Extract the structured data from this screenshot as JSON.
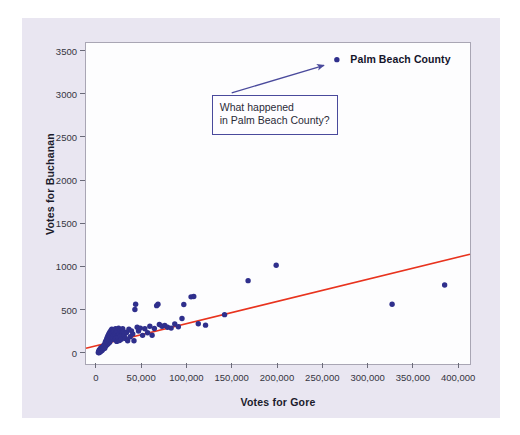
{
  "figure": {
    "background_color": "#e9e6f1",
    "plot_background_color": "#fdfdfe",
    "frame_color": "#a9a6b4"
  },
  "chart_data": {
    "type": "scatter",
    "title": "",
    "xlabel": "Votes for Gore",
    "ylabel": "Votes for Buchanan",
    "xlim": [
      -12000,
      412000
    ],
    "ylim": [
      -120,
      3600
    ],
    "xticks": [
      0,
      50000,
      100000,
      150000,
      200000,
      250000,
      300000,
      350000,
      400000
    ],
    "xticklabels": [
      "0",
      "50,000",
      "100,000",
      "150,000",
      "200,000",
      "250,000",
      "300,000",
      "350,000",
      "400,000"
    ],
    "yticks": [
      0,
      500,
      1000,
      1500,
      2000,
      2500,
      3000,
      3500
    ],
    "yticklabels": [
      "0",
      "500",
      "1000",
      "1500",
      "2000",
      "2500",
      "3000",
      "3500"
    ],
    "grid": false,
    "legend": null,
    "marker_color": "#2f2f8c",
    "marker_size": 5.4,
    "series": [
      {
        "name": "Florida counties",
        "points": [
          [
            2300,
            10
          ],
          [
            3000,
            25
          ],
          [
            3400,
            36
          ],
          [
            2700,
            42
          ],
          [
            4200,
            30
          ],
          [
            3900,
            55
          ],
          [
            5000,
            45
          ],
          [
            4500,
            70
          ],
          [
            5600,
            60
          ],
          [
            6100,
            78
          ],
          [
            6800,
            65
          ],
          [
            7200,
            90
          ],
          [
            7900,
            82
          ],
          [
            8300,
            105
          ],
          [
            8900,
            96
          ],
          [
            9500,
            120
          ],
          [
            10200,
            110
          ],
          [
            11000,
            135
          ],
          [
            11800,
            125
          ],
          [
            12400,
            150
          ],
          [
            13100,
            140
          ],
          [
            13900,
            165
          ],
          [
            14600,
            158
          ],
          [
            15300,
            180
          ],
          [
            16100,
            172
          ],
          [
            2100,
            18
          ],
          [
            2500,
            30
          ],
          [
            3200,
            20
          ],
          [
            3800,
            38
          ],
          [
            4400,
            28
          ],
          [
            5200,
            52
          ],
          [
            5900,
            40
          ],
          [
            6500,
            72
          ],
          [
            7100,
            58
          ],
          [
            7700,
            85
          ],
          [
            8500,
            68
          ],
          [
            9100,
            98
          ],
          [
            9800,
            88
          ],
          [
            10500,
            115
          ],
          [
            11300,
            102
          ],
          [
            12000,
            128
          ],
          [
            12700,
            118
          ],
          [
            13500,
            145
          ],
          [
            14200,
            132
          ],
          [
            15000,
            155
          ],
          [
            1600,
            12
          ],
          [
            1900,
            22
          ],
          [
            2800,
            16
          ],
          [
            3500,
            48
          ],
          [
            4800,
            34
          ],
          [
            5400,
            62
          ],
          [
            6200,
            50
          ],
          [
            7400,
            75
          ],
          [
            8100,
            92
          ],
          [
            8700,
            62
          ],
          [
            9300,
            132
          ],
          [
            10000,
            148
          ],
          [
            10800,
            168
          ],
          [
            11500,
            188
          ],
          [
            12200,
            205
          ],
          [
            13000,
            222
          ],
          [
            13800,
            238
          ],
          [
            14500,
            252
          ],
          [
            15600,
            268
          ],
          [
            16500,
            282
          ],
          [
            17300,
            240
          ],
          [
            18100,
            256
          ],
          [
            19000,
            272
          ],
          [
            17800,
            190
          ],
          [
            18600,
            206
          ],
          [
            19800,
            225
          ],
          [
            20600,
            288
          ],
          [
            21400,
            244
          ],
          [
            22300,
            262
          ],
          [
            23100,
            208
          ],
          [
            24000,
            296
          ],
          [
            24800,
            232
          ],
          [
            25700,
            276
          ],
          [
            26600,
            216
          ],
          [
            27500,
            248
          ],
          [
            20000,
            160
          ],
          [
            21000,
            175
          ],
          [
            22000,
            142
          ],
          [
            23500,
            186
          ],
          [
            25000,
            152
          ],
          [
            26000,
            198
          ],
          [
            27000,
            168
          ],
          [
            28500,
            290
          ],
          [
            29400,
            256
          ],
          [
            30200,
            212
          ],
          [
            31500,
            176
          ],
          [
            32800,
            246
          ],
          [
            34000,
            150
          ],
          [
            35400,
            282
          ],
          [
            36800,
            196
          ],
          [
            38200,
            264
          ],
          [
            39600,
            228
          ],
          [
            41000,
            150
          ],
          [
            42000,
            512
          ],
          [
            42800,
            572
          ],
          [
            44500,
            306
          ],
          [
            46000,
            262
          ],
          [
            48000,
            296
          ],
          [
            50500,
            212
          ],
          [
            53000,
            288
          ],
          [
            56000,
            242
          ],
          [
            58500,
            318
          ],
          [
            61000,
            214
          ],
          [
            63500,
            292
          ],
          [
            66000,
            556
          ],
          [
            67500,
            572
          ],
          [
            69000,
            338
          ],
          [
            72000,
            318
          ],
          [
            75000,
            328
          ],
          [
            78000,
            306
          ],
          [
            82000,
            296
          ],
          [
            86000,
            344
          ],
          [
            90000,
            312
          ],
          [
            94000,
            408
          ],
          [
            96000,
            570
          ],
          [
            104000,
            658
          ],
          [
            107000,
            662
          ],
          [
            112000,
            346
          ],
          [
            120000,
            330
          ],
          [
            141000,
            452
          ],
          [
            167000,
            846
          ],
          [
            198000,
            1025
          ],
          [
            326000,
            572
          ],
          [
            384000,
            795
          ],
          [
            265000,
            3407
          ]
        ]
      }
    ],
    "trendline": {
      "name": "regression line",
      "color": "#e8331e",
      "x_start": -12000,
      "y_start": 62,
      "x_end": 412000,
      "y_end": 1152,
      "width": 1.6
    },
    "annotations": [
      {
        "name": "palm-beach-outlier-label",
        "text": "Palm Beach County",
        "x": 281000,
        "y": 3407
      },
      {
        "name": "callout",
        "line1": "What happened",
        "line2": "in Palm Beach County?",
        "box_x": 128000,
        "box_y": 2990,
        "border_color": "#4a4a9c",
        "arrow_from_x": 150000,
        "arrow_from_y": 3010,
        "arrow_to_x": 252000,
        "arrow_to_y": 3330,
        "arrow_color": "#4a4a9c"
      }
    ]
  }
}
